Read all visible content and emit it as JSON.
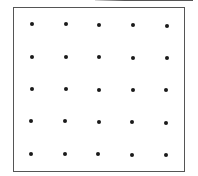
{
  "figure": {
    "grid": {
      "rows": 5,
      "cols": 5,
      "dots": [
        [
          {
            "x": 32,
            "y": 24
          },
          {
            "x": 66,
            "y": 24
          },
          {
            "x": 99,
            "y": 25
          },
          {
            "x": 133,
            "y": 25
          },
          {
            "x": 167,
            "y": 26
          }
        ],
        [
          {
            "x": 32,
            "y": 57
          },
          {
            "x": 66,
            "y": 57
          },
          {
            "x": 99,
            "y": 57
          },
          {
            "x": 133,
            "y": 58
          },
          {
            "x": 167,
            "y": 58
          }
        ],
        [
          {
            "x": 32,
            "y": 89
          },
          {
            "x": 66,
            "y": 89
          },
          {
            "x": 99,
            "y": 90
          },
          {
            "x": 133,
            "y": 90
          },
          {
            "x": 166,
            "y": 90
          }
        ],
        [
          {
            "x": 31,
            "y": 121
          },
          {
            "x": 65,
            "y": 121
          },
          {
            "x": 99,
            "y": 122
          },
          {
            "x": 132,
            "y": 122
          },
          {
            "x": 166,
            "y": 123
          }
        ],
        [
          {
            "x": 31,
            "y": 154
          },
          {
            "x": 65,
            "y": 154
          },
          {
            "x": 98,
            "y": 154
          },
          {
            "x": 132,
            "y": 155
          },
          {
            "x": 166,
            "y": 155
          }
        ]
      ]
    },
    "colors": {
      "frame": "#555555",
      "dot": "#1a1a1a",
      "background": "#ffffff"
    }
  }
}
